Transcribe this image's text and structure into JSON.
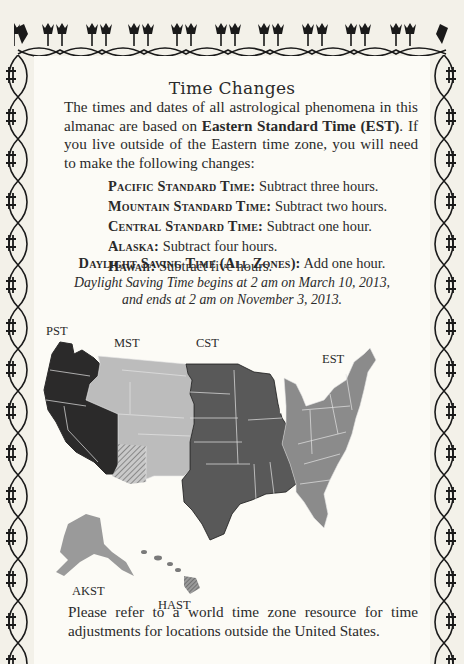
{
  "title": "Time Changes",
  "intro": {
    "part1": "The times and dates of all astrological phenomena in this almanac are based on ",
    "bold": "Eastern Standard Time (EST)",
    "part2": ". If you live outside of the Eastern time zone, you will need to make the following changes:"
  },
  "rules": [
    {
      "zone": "Pacific Standard Time:",
      "change": "Subtract three hours."
    },
    {
      "zone": "Mountain Standard Time:",
      "change": "Subtract two hours."
    },
    {
      "zone": "Central Standard Time:",
      "change": "Subtract one hour."
    },
    {
      "zone": "Alaska:",
      "change": "Subtract four hours."
    },
    {
      "zone": "Hawaii:",
      "change": "Subtract five hours."
    }
  ],
  "dst": {
    "zone": "Daylight Saving Time (All Zones):",
    "change": "Add one hour.",
    "note_line1": "Daylight Saving Time begins at 2 am on March 10, 2013,",
    "note_line2": "and ends at 2 am on November 3, 2013."
  },
  "map": {
    "labels": {
      "pst": "PST",
      "mst": "MST",
      "cst": "CST",
      "est": "EST",
      "akst": "AKST",
      "hast": "HAST"
    },
    "colors": {
      "pst": "#2b2a2a",
      "mst": "#bcbcbc",
      "cst": "#595959",
      "est": "#8b8b8b",
      "akst": "#9a9a9a",
      "hast": "#7a7a7a",
      "borders": "#e8e8e8"
    }
  },
  "outro": "Please refer to a world time zone resource for time adjustments for locations outside the United States."
}
